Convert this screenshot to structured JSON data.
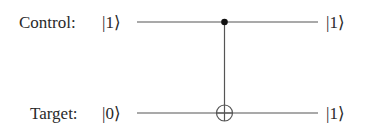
{
  "circuit": {
    "gate": "CNOT",
    "control": {
      "label": "Control:",
      "input_state": "|1⟩",
      "output_state": "|1⟩"
    },
    "target": {
      "label": "Target:",
      "input_state": "|0⟩",
      "output_state": "|1⟩"
    }
  },
  "colors": {
    "line": "#555555",
    "text": "#2a2a2a",
    "dot": "#111111"
  }
}
